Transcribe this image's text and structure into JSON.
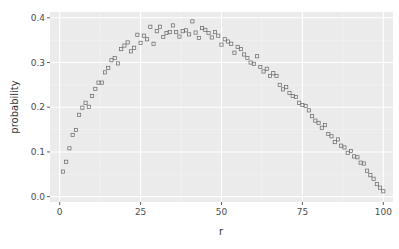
{
  "chart_data": {
    "type": "scatter",
    "title": "",
    "xlabel": "r",
    "ylabel": "probability",
    "xlim": [
      -3,
      103
    ],
    "ylim": [
      -0.012,
      0.413
    ],
    "x_ticks": [
      0,
      25,
      50,
      75,
      100
    ],
    "x_tick_labels": [
      "0",
      "25",
      "50",
      "75",
      "100"
    ],
    "y_ticks": [
      0.0,
      0.1,
      0.2,
      0.3,
      0.4
    ],
    "y_tick_labels": [
      "0.0",
      "0.1",
      "0.2",
      "0.3",
      "0.4"
    ],
    "grid": true,
    "legend": "none",
    "marker": "open-square",
    "colors": {
      "panel_bg": "#ebebeb",
      "grid_major": "#ffffff",
      "grid_minor": "#f5f5f5",
      "point": "#666666",
      "text": "#4d4d4d"
    },
    "x": [
      1,
      2,
      3,
      4,
      5,
      6,
      7,
      8,
      9,
      10,
      11,
      12,
      13,
      14,
      15,
      16,
      17,
      18,
      19,
      20,
      21,
      22,
      23,
      24,
      25,
      26,
      27,
      28,
      29,
      30,
      31,
      32,
      33,
      34,
      35,
      36,
      37,
      38,
      39,
      40,
      41,
      42,
      43,
      44,
      45,
      46,
      47,
      48,
      49,
      50,
      51,
      52,
      53,
      54,
      55,
      56,
      57,
      58,
      59,
      60,
      61,
      62,
      63,
      64,
      65,
      66,
      67,
      68,
      69,
      70,
      71,
      72,
      73,
      74,
      75,
      76,
      77,
      78,
      79,
      80,
      81,
      82,
      83,
      84,
      85,
      86,
      87,
      88,
      89,
      90,
      91,
      92,
      93,
      94,
      95,
      96,
      97,
      98,
      99,
      100
    ],
    "y": [
      0.056,
      0.078,
      0.108,
      0.138,
      0.149,
      0.183,
      0.199,
      0.21,
      0.201,
      0.225,
      0.241,
      0.255,
      0.255,
      0.278,
      0.288,
      0.305,
      0.31,
      0.298,
      0.33,
      0.338,
      0.345,
      0.325,
      0.333,
      0.362,
      0.344,
      0.36,
      0.352,
      0.38,
      0.342,
      0.37,
      0.38,
      0.357,
      0.366,
      0.368,
      0.383,
      0.368,
      0.358,
      0.37,
      0.372,
      0.363,
      0.392,
      0.367,
      0.355,
      0.377,
      0.373,
      0.366,
      0.356,
      0.368,
      0.36,
      0.34,
      0.352,
      0.347,
      0.342,
      0.322,
      0.335,
      0.33,
      0.318,
      0.31,
      0.3,
      0.297,
      0.314,
      0.29,
      0.28,
      0.286,
      0.27,
      0.276,
      0.27,
      0.25,
      0.24,
      0.245,
      0.232,
      0.225,
      0.223,
      0.21,
      0.205,
      0.203,
      0.193,
      0.18,
      0.17,
      0.165,
      0.154,
      0.16,
      0.14,
      0.135,
      0.122,
      0.128,
      0.114,
      0.11,
      0.098,
      0.102,
      0.09,
      0.088,
      0.076,
      0.074,
      0.058,
      0.048,
      0.04,
      0.028,
      0.02,
      0.012
    ]
  }
}
